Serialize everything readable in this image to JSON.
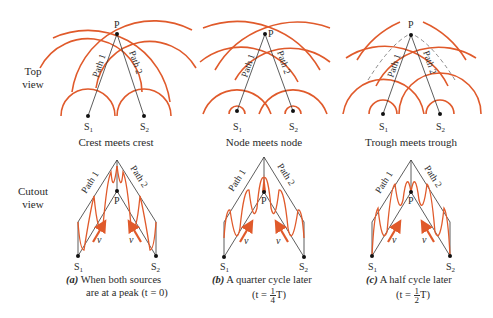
{
  "row_labels": {
    "top": [
      "Top",
      "view"
    ],
    "cutout": [
      "Cutout",
      "view"
    ]
  },
  "colors": {
    "wave": "#e05a2b",
    "line": "#333333",
    "dashed": "#8a8a8a"
  },
  "panels": [
    {
      "id": "a",
      "top_caption": "Crest meets crest",
      "point_label": "P",
      "source1": "S",
      "source1_sub": "1",
      "source2": "S",
      "source2_sub": "2",
      "path1": "Path 1",
      "path2": "Path 2",
      "velocity": "v",
      "label_letter": "(a)",
      "label_line1": "When both sources",
      "label_line2": "are at a peak (t = 0)"
    },
    {
      "id": "b",
      "top_caption": "Node meets node",
      "point_label": "P",
      "source1": "S",
      "source1_sub": "1",
      "source2": "S",
      "source2_sub": "2",
      "path1": "Path 1",
      "path2": "Path 2",
      "velocity": "v",
      "label_letter": "(b)",
      "label_line1": "A quarter cycle later",
      "time_prefix": "(t =",
      "frac_num": "1",
      "frac_den": "4",
      "time_suffix": "T)"
    },
    {
      "id": "c",
      "top_caption": "Trough meets trough",
      "point_label": "P",
      "source1": "S",
      "source1_sub": "1",
      "source2": "S",
      "source2_sub": "2",
      "path1": "Path 1",
      "path2": "Path 2",
      "velocity": "v",
      "label_letter": "(c)",
      "label_line1": "A half cycle later",
      "time_prefix": "(t =",
      "frac_num": "1",
      "frac_den": "2",
      "time_suffix": "T)"
    }
  ]
}
